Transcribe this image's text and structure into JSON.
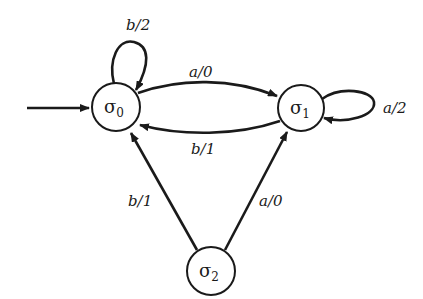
{
  "diagram": {
    "type": "finite-state-machine",
    "states": [
      {
        "id": "s0",
        "symbol": "σ",
        "subscript": "0",
        "initial": true
      },
      {
        "id": "s1",
        "symbol": "σ",
        "subscript": "1",
        "initial": false
      },
      {
        "id": "s2",
        "symbol": "σ",
        "subscript": "2",
        "initial": false
      }
    ],
    "transitions": [
      {
        "from": "s0",
        "to": "s0",
        "label": "b/2"
      },
      {
        "from": "s0",
        "to": "s1",
        "label": "a/0"
      },
      {
        "from": "s1",
        "to": "s0",
        "label": "b/1"
      },
      {
        "from": "s1",
        "to": "s1",
        "label": "a/2"
      },
      {
        "from": "s2",
        "to": "s0",
        "label": "b/1"
      },
      {
        "from": "s2",
        "to": "s1",
        "label": "a/0"
      }
    ]
  },
  "labels": {
    "s0": {
      "sym": "σ",
      "sub": "0"
    },
    "s1": {
      "sym": "σ",
      "sub": "1"
    },
    "s2": {
      "sym": "σ",
      "sub": "2"
    },
    "loop_s0": "b/2",
    "s0_s1": "a/0",
    "s1_s0": "b/1",
    "loop_s1": "a/2",
    "s2_s0": "b/1",
    "s2_s1": "a/0"
  }
}
